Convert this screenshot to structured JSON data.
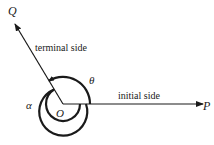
{
  "diagram": {
    "type": "angle-diagram",
    "labels": {
      "Q": "Q",
      "P": "P",
      "O": "O",
      "terminal_side": "terminal side",
      "initial_side": "initial side",
      "theta": "θ",
      "alpha": "α"
    },
    "colors": {
      "ink": "#1a1a1a",
      "background": "#ffffff"
    }
  }
}
